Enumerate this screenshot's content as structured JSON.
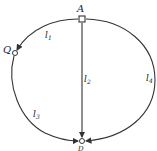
{
  "diagram": {
    "nodes": [
      {
        "id": "A",
        "label": "A",
        "shape": "square",
        "x": 82,
        "y": 19
      },
      {
        "id": "Q",
        "label": "Q",
        "shape": "circle",
        "x": 15,
        "y": 53
      },
      {
        "id": "D",
        "label": "D",
        "shape": "circle",
        "x": 82,
        "y": 141
      }
    ],
    "edges": [
      {
        "id": "l1",
        "label": "l",
        "subscript": "1",
        "from": "A",
        "to": "Q",
        "path": "upper-left arc"
      },
      {
        "id": "l2",
        "label": "l",
        "subscript": "2",
        "from": "A",
        "to": "D",
        "path": "straight vertical"
      },
      {
        "id": "l3",
        "label": "l",
        "subscript": "3",
        "from": "Q",
        "to": "D",
        "path": "lower-left arc"
      },
      {
        "id": "l4",
        "label": "l",
        "subscript": "4",
        "from": "A",
        "to": "D",
        "path": "right arc"
      }
    ],
    "colors": {
      "stroke": "#333333",
      "background": "#ffffff"
    }
  }
}
